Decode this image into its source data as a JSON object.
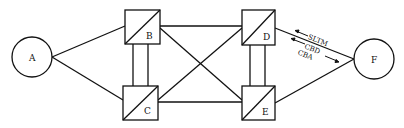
{
  "diagram": {
    "nodes": [
      {
        "id": "A",
        "label": "A",
        "shape": "circle"
      },
      {
        "id": "B",
        "label": "B",
        "shape": "box"
      },
      {
        "id": "C",
        "label": "C",
        "shape": "box"
      },
      {
        "id": "D",
        "label": "D",
        "shape": "box"
      },
      {
        "id": "E",
        "label": "E",
        "shape": "box"
      },
      {
        "id": "F",
        "label": "F",
        "shape": "circle"
      }
    ],
    "edges": [
      [
        "A",
        "B"
      ],
      [
        "A",
        "C"
      ],
      [
        "B",
        "C"
      ],
      [
        "B",
        "D"
      ],
      [
        "B",
        "E"
      ],
      [
        "C",
        "D"
      ],
      [
        "C",
        "E"
      ],
      [
        "D",
        "E"
      ],
      [
        "D",
        "F"
      ],
      [
        "E",
        "F"
      ]
    ],
    "messages": [
      {
        "label": "SLTM",
        "direction": "F-to-D"
      },
      {
        "label": "CBD",
        "direction": "F-to-D"
      },
      {
        "label": "CBA",
        "direction": "D-to-F"
      }
    ]
  }
}
